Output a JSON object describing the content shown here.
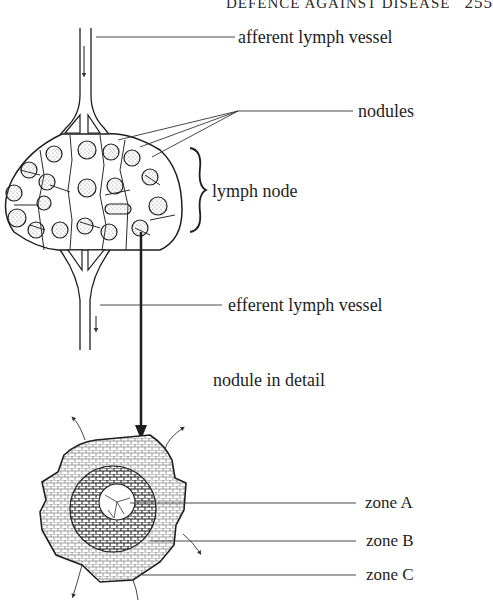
{
  "header": {
    "running_title": "DEFENCE AGAINST DISEASE",
    "page_number": "255"
  },
  "figure": {
    "labels": {
      "afferent": "afferent  lymph vessel",
      "nodules": "nodules",
      "lymph_node": "lymph node",
      "efferent": "efferent lymph vessel",
      "nodule_detail": "nodule in detail",
      "zone_a": "zone A",
      "zone_b": "zone B",
      "zone_c": "zone C"
    },
    "colors": {
      "ink": "#1e1e1e",
      "background": "#ffffff",
      "stipple": "#8a8a8a"
    }
  }
}
